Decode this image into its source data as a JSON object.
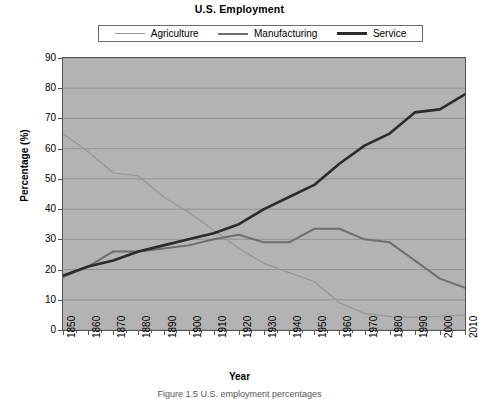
{
  "chart_data": {
    "type": "line",
    "title": "U.S. Employment",
    "xlabel": "Year",
    "ylabel": "Percentage (%)",
    "xlim": [
      1850,
      2010
    ],
    "ylim": [
      0,
      90
    ],
    "ytick_step": 10,
    "xtick_step": 10,
    "grid": "horizontal",
    "legend_position": "top-center",
    "plot_background": "#b3b3b3",
    "x": [
      1850,
      1860,
      1870,
      1880,
      1890,
      1900,
      1910,
      1920,
      1930,
      1940,
      1950,
      1960,
      1970,
      1980,
      1990,
      2000,
      2010
    ],
    "xtick_labels": [
      "1850",
      "1860",
      "1870",
      "1880",
      "1890",
      "1900",
      "1910",
      "1920",
      "1930",
      "1940",
      "1950",
      "1960",
      "1970",
      "1980",
      "1990",
      "2000",
      "2010"
    ],
    "ytick_labels": [
      "0",
      "10",
      "20",
      "30",
      "40",
      "50",
      "60",
      "70",
      "80",
      "90"
    ],
    "series": [
      {
        "name": "Agriculture",
        "color": "#999999",
        "width": 1.4,
        "values": [
          65,
          59,
          52,
          51,
          44,
          39,
          33,
          27,
          22,
          19,
          16,
          9,
          5.5,
          4.5,
          4.2,
          4.5,
          5
        ]
      },
      {
        "name": "Manufacturing",
        "color": "#6e6e6e",
        "width": 2.0,
        "values": [
          17.5,
          21,
          26,
          26,
          27,
          28,
          30,
          31.5,
          29,
          29,
          33.5,
          33.5,
          30,
          29,
          23,
          17,
          14
        ]
      },
      {
        "name": "Service",
        "color": "#2b2b2b",
        "width": 2.6,
        "values": [
          18,
          21,
          23,
          26,
          28,
          30,
          32,
          35,
          40,
          44,
          48,
          55,
          61,
          65,
          72,
          73,
          78
        ]
      }
    ]
  },
  "caption": {
    "text": "Figure 1.5   U.S. employment percentages"
  }
}
